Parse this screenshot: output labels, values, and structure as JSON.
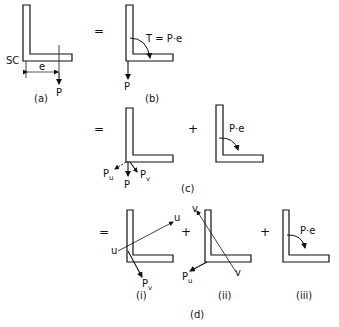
{
  "figure": {
    "panels": {
      "a": {
        "caption": "(a)",
        "shear_center_label": "SC",
        "eccentricity_label": "e",
        "load_label": "P"
      },
      "b": {
        "caption": "(b)",
        "prefix": "=",
        "torque_label": "T = P·e",
        "load_label": "P"
      },
      "c": {
        "caption": "(c)",
        "prefix": "=",
        "plus": "+",
        "load_label": "P",
        "component_u_label": "P",
        "component_u_sub": "u",
        "component_v_label": "P",
        "component_v_sub": "v",
        "torque_label": "P·e"
      },
      "d": {
        "caption": "(d)",
        "prefix": "=",
        "plus_1": "+",
        "plus_2": "+",
        "sub_i": {
          "caption": "(i)",
          "axis_start": "u",
          "axis_end": "u",
          "load_label": "P",
          "load_sub": "v"
        },
        "sub_ii": {
          "caption": "(ii)",
          "axis_start": "v",
          "axis_end": "v",
          "load_label": "P",
          "load_sub": "u"
        },
        "sub_iii": {
          "caption": "(iii)",
          "torque_label": "P·e"
        }
      }
    }
  }
}
